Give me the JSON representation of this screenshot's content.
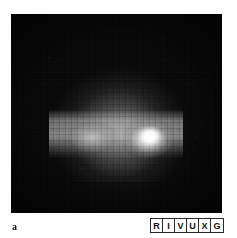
{
  "figure": {
    "panel_label": "a",
    "type": "astronomical-image",
    "background_color": "#ffffff",
    "plate_color": "#070707",
    "peak_color": "#ffffff"
  },
  "wavelength_indicator": {
    "name": "RIVUXG",
    "bands": [
      {
        "letter": "R",
        "meaning": "Radio",
        "highlighted": true
      },
      {
        "letter": "I",
        "meaning": "Infrared",
        "highlighted": false
      },
      {
        "letter": "V",
        "meaning": "Visible",
        "highlighted": false
      },
      {
        "letter": "U",
        "meaning": "Ultraviolet",
        "highlighted": false
      },
      {
        "letter": "X",
        "meaning": "X-ray",
        "highlighted": false
      },
      {
        "letter": "G",
        "meaning": "Gamma ray",
        "highlighted": false
      }
    ]
  },
  "chart_data": {
    "type": "heatmap",
    "title": "",
    "xlabel": "",
    "ylabel": "",
    "colormap": "grayscale",
    "grid": false,
    "legend": "none",
    "note": "Relative surface brightness per detector pixel, 0 = black sky, 100 = saturated white core",
    "features": [
      {
        "name": "outer-halo",
        "center_x_pct": 52,
        "center_y_pct": 52,
        "brightness": 18
      },
      {
        "name": "mid-halo",
        "center_x_pct": 52,
        "center_y_pct": 58,
        "brightness": 34
      },
      {
        "name": "emission-band",
        "center_x_pct": 50,
        "center_y_pct": 60,
        "brightness": 55
      },
      {
        "name": "western-knot",
        "center_x_pct": 38,
        "center_y_pct": 61,
        "brightness": 70
      },
      {
        "name": "bright-core",
        "center_x_pct": 66,
        "center_y_pct": 62,
        "brightness": 100
      }
    ]
  }
}
